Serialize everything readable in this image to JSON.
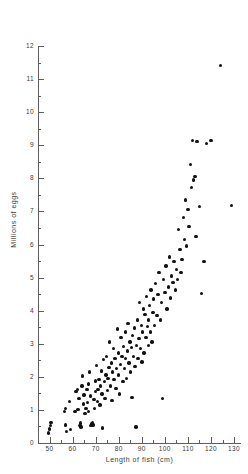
{
  "chart_data": {
    "type": "scatter",
    "title": "",
    "xlabel": "Length of fish (cm)",
    "ylabel": "Millions of eggs",
    "xlim": [
      45,
      133
    ],
    "ylim": [
      0,
      12
    ],
    "grid": false,
    "legend": null,
    "x_ticks": [
      50,
      60,
      70,
      80,
      90,
      100,
      110,
      120,
      130
    ],
    "x_tick_labels": [
      "50",
      "60",
      "70",
      "80",
      "90",
      "100",
      "110",
      "120",
      "130"
    ],
    "x_minor_ticks": [
      55,
      65,
      75,
      85,
      95,
      105,
      115,
      125
    ],
    "y_ticks": [
      0,
      1,
      2,
      3,
      4,
      5,
      6,
      7,
      8,
      9,
      10,
      11,
      12
    ],
    "y_tick_labels": [
      "0",
      "1",
      "2",
      "3",
      "4",
      "5",
      "6",
      "7",
      "8",
      "9",
      "10",
      "11",
      "12"
    ],
    "y_minor_ticks": [
      0.5,
      1.5,
      2.5,
      3.5,
      4.5,
      5.5,
      6.5,
      7.5,
      8.5,
      9.5,
      10.5,
      11.5
    ],
    "marker": "filled-circle",
    "marker_color": "#111111",
    "points": [
      [
        49.5,
        0.3
      ],
      [
        50.0,
        0.42
      ],
      [
        50.3,
        0.52
      ],
      [
        50.6,
        0.62
      ],
      [
        56.5,
        0.95
      ],
      [
        56.8,
        1.05
      ],
      [
        57.0,
        0.55
      ],
      [
        57.3,
        0.35
      ],
      [
        58.6,
        1.25
      ],
      [
        59.2,
        0.4
      ],
      [
        61.0,
        0.95
      ],
      [
        61.4,
        1.55
      ],
      [
        62.0,
        1.62
      ],
      [
        62.4,
        1.02
      ],
      [
        62.8,
        1.35
      ],
      [
        63.2,
        0.52
      ],
      [
        63.4,
        0.6
      ],
      [
        63.6,
        0.48
      ],
      [
        64.0,
        1.72
      ],
      [
        64.4,
        2.02
      ],
      [
        64.8,
        1.18
      ],
      [
        65.0,
        1.45
      ],
      [
        65.4,
        0.9
      ],
      [
        65.8,
        1.05
      ],
      [
        66.2,
        1.62
      ],
      [
        66.5,
        1.22
      ],
      [
        66.8,
        0.95
      ],
      [
        67.0,
        1.78
      ],
      [
        67.4,
        2.15
      ],
      [
        67.8,
        1.42
      ],
      [
        68.0,
        0.52
      ],
      [
        68.3,
        0.58
      ],
      [
        68.6,
        0.62
      ],
      [
        68.9,
        0.55
      ],
      [
        69.2,
        1.32
      ],
      [
        69.5,
        1.05
      ],
      [
        69.8,
        1.88
      ],
      [
        70.0,
        1.55
      ],
      [
        70.4,
        2.35
      ],
      [
        70.8,
        1.25
      ],
      [
        71.0,
        1.62
      ],
      [
        71.4,
        1.92
      ],
      [
        71.8,
        1.15
      ],
      [
        72.0,
        1.72
      ],
      [
        72.4,
        2.18
      ],
      [
        72.8,
        1.48
      ],
      [
        73.0,
        0.45
      ],
      [
        73.4,
        2.52
      ],
      [
        73.8,
        1.85
      ],
      [
        74.0,
        1.35
      ],
      [
        74.4,
        2.05
      ],
      [
        74.8,
        2.62
      ],
      [
        75.0,
        1.58
      ],
      [
        75.4,
        1.95
      ],
      [
        75.8,
        2.28
      ],
      [
        76.0,
        3.05
      ],
      [
        76.4,
        1.72
      ],
      [
        76.8,
        2.42
      ],
      [
        77.0,
        1.28
      ],
      [
        77.4,
        2.15
      ],
      [
        77.8,
        2.85
      ],
      [
        78.0,
        1.92
      ],
      [
        78.4,
        2.55
      ],
      [
        78.8,
        1.65
      ],
      [
        79.0,
        2.25
      ],
      [
        79.4,
        3.45
      ],
      [
        79.8,
        2.05
      ],
      [
        80.0,
        2.72
      ],
      [
        80.4,
        1.48
      ],
      [
        80.8,
        2.38
      ],
      [
        81.0,
        3.18
      ],
      [
        81.4,
        2.62
      ],
      [
        81.8,
        1.85
      ],
      [
        82.0,
        2.92
      ],
      [
        82.4,
        2.25
      ],
      [
        82.8,
        3.35
      ],
      [
        83.0,
        2.55
      ],
      [
        83.4,
        1.95
      ],
      [
        83.8,
        2.78
      ],
      [
        84.0,
        3.62
      ],
      [
        84.4,
        2.42
      ],
      [
        84.8,
        3.05
      ],
      [
        85.0,
        2.15
      ],
      [
        85.4,
        2.88
      ],
      [
        85.8,
        1.38
      ],
      [
        86.0,
        3.25
      ],
      [
        86.4,
        2.62
      ],
      [
        86.8,
        3.48
      ],
      [
        87.0,
        2.32
      ],
      [
        87.4,
        0.48
      ],
      [
        87.8,
        2.95
      ],
      [
        88.0,
        3.72
      ],
      [
        88.4,
        2.55
      ],
      [
        88.8,
        3.15
      ],
      [
        89.0,
        4.25
      ],
      [
        89.4,
        2.85
      ],
      [
        89.8,
        3.55
      ],
      [
        90.0,
        2.45
      ],
      [
        90.4,
        3.35
      ],
      [
        90.8,
        4.05
      ],
      [
        91.0,
        2.72
      ],
      [
        91.4,
        3.88
      ],
      [
        91.8,
        3.18
      ],
      [
        92.0,
        4.42
      ],
      [
        92.4,
        3.52
      ],
      [
        92.8,
        2.95
      ],
      [
        93.0,
        3.72
      ],
      [
        93.4,
        4.15
      ],
      [
        93.8,
        3.35
      ],
      [
        94.0,
        4.62
      ],
      [
        94.4,
        3.05
      ],
      [
        94.8,
        3.95
      ],
      [
        95.0,
        4.35
      ],
      [
        95.4,
        3.55
      ],
      [
        96.0,
        4.82
      ],
      [
        96.5,
        3.85
      ],
      [
        97.0,
        4.48
      ],
      [
        97.5,
        5.15
      ],
      [
        98.0,
        3.72
      ],
      [
        98.5,
        4.25
      ],
      [
        99.0,
        1.35
      ],
      [
        99.5,
        4.95
      ],
      [
        100.0,
        4.55
      ],
      [
        100.5,
        5.35
      ],
      [
        101.0,
        4.05
      ],
      [
        101.5,
        4.72
      ],
      [
        102.0,
        5.62
      ],
      [
        102.5,
        4.38
      ],
      [
        103.0,
        5.05
      ],
      [
        103.5,
        4.85
      ],
      [
        104.0,
        5.48
      ],
      [
        104.5,
        4.62
      ],
      [
        105.0,
        5.25
      ],
      [
        105.5,
        4.95
      ],
      [
        106.0,
        6.45
      ],
      [
        106.5,
        5.85
      ],
      [
        107.0,
        5.15
      ],
      [
        107.5,
        5.55
      ],
      [
        108.0,
        6.82
      ],
      [
        108.5,
        6.15
      ],
      [
        109.0,
        7.35
      ],
      [
        109.5,
        5.95
      ],
      [
        110.0,
        7.05
      ],
      [
        110.5,
        6.55
      ],
      [
        111.0,
        8.42
      ],
      [
        111.5,
        7.72
      ],
      [
        112.0,
        9.15
      ],
      [
        112.5,
        7.95
      ],
      [
        113.0,
        8.05
      ],
      [
        113.5,
        6.25
      ],
      [
        114.0,
        9.12
      ],
      [
        115.0,
        7.15
      ],
      [
        116.0,
        4.52
      ],
      [
        117.0,
        5.48
      ],
      [
        118.0,
        9.05
      ],
      [
        120.0,
        9.15
      ],
      [
        124.0,
        11.42
      ],
      [
        129.0,
        7.18
      ]
    ]
  },
  "axes": {
    "x_title": "Length of fish (cm)",
    "y_title": "Millions of eggs"
  }
}
